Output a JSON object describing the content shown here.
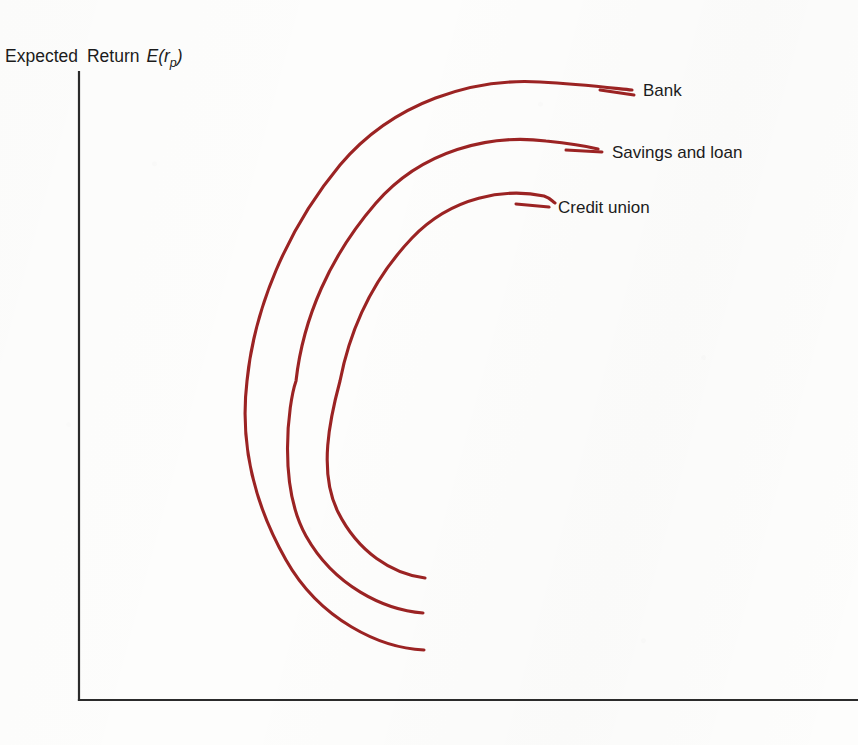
{
  "figure": {
    "background_color": "#fdfdfc",
    "axis_color": "#2b2b2b",
    "curve_color": "#9b2323",
    "width": 858,
    "height": 745
  },
  "axes": {
    "y_axis_label_part1": "Expected",
    "y_axis_label_part2": "Return",
    "y_axis_label_symbol": "E(r",
    "y_axis_label_subscript": "p",
    "y_axis_label_close": ")",
    "y_axis_label_full": "Expected Return E(r_p)",
    "x_axis_label": "",
    "origin_x": 79,
    "origin_y": 700,
    "y_axis_top": 72,
    "x_axis_right": 858
  },
  "chart_data": {
    "type": "line",
    "title": "",
    "subtitle": "",
    "xlabel": "",
    "ylabel": "Expected Return E(r_p)",
    "grid": false,
    "legend_position": "right-inline-labels",
    "axis_ticks": {
      "x": [],
      "y": []
    },
    "series": [
      {
        "name": "Bank",
        "label": "Bank",
        "color": "#9b2323",
        "rank": 1,
        "label_x": 643,
        "label_y": 96,
        "leader_line": {
          "x1": 600,
          "y1": 90,
          "x2": 634,
          "y2": 95
        },
        "path": "M 424,650 C 380,648 320,620 286,560 C 252,500 240,440 247,381 C 254,310 286,230 340,165 C 394,101 474,78 540,82 C 580,84 612,88 632,90",
        "points": [
          {
            "x": 424,
            "y": 650
          },
          {
            "x": 350,
            "y": 625
          },
          {
            "x": 290,
            "y": 565
          },
          {
            "x": 252,
            "y": 470
          },
          {
            "x": 247,
            "y": 381
          },
          {
            "x": 268,
            "y": 280
          },
          {
            "x": 320,
            "y": 190
          },
          {
            "x": 400,
            "y": 117
          },
          {
            "x": 500,
            "y": 83
          },
          {
            "x": 580,
            "y": 85
          },
          {
            "x": 632,
            "y": 90
          }
        ]
      },
      {
        "name": "Savings and loan",
        "label": "Savings and loan",
        "color": "#9b2323",
        "rank": 2,
        "label_x": 612,
        "label_y": 158,
        "leader_line": {
          "x1": 566,
          "y1": 150,
          "x2": 602,
          "y2": 152
        },
        "path": "M 423,613 C 384,610 334,586 306,536 C 278,486 288,404 296,381 C 303,318 330,256 376,203 C 422,150 490,134 546,141 C 576,144 586,146 598,149",
        "points": [
          {
            "x": 423,
            "y": 613
          },
          {
            "x": 360,
            "y": 592
          },
          {
            "x": 310,
            "y": 540
          },
          {
            "x": 292,
            "y": 455
          },
          {
            "x": 296,
            "y": 381
          },
          {
            "x": 313,
            "y": 300
          },
          {
            "x": 356,
            "y": 226
          },
          {
            "x": 428,
            "y": 166
          },
          {
            "x": 510,
            "y": 140
          },
          {
            "x": 570,
            "y": 145
          },
          {
            "x": 598,
            "y": 149
          }
        ]
      },
      {
        "name": "Credit union",
        "label": "Credit union",
        "color": "#9b2323",
        "rank": 3,
        "label_x": 558,
        "label_y": 213,
        "leader_line": {
          "x1": 516,
          "y1": 204,
          "x2": 549,
          "y2": 207
        },
        "path": "M 425,578 C 392,574 358,552 338,512 C 318,472 330,418 340,381 C 350,330 372,280 412,238 C 452,196 506,188 544,196 C 550,198 552,201 555,203",
        "points": [
          {
            "x": 425,
            "y": 578
          },
          {
            "x": 375,
            "y": 562
          },
          {
            "x": 344,
            "y": 518
          },
          {
            "x": 336,
            "y": 452
          },
          {
            "x": 340,
            "y": 381
          },
          {
            "x": 355,
            "y": 318
          },
          {
            "x": 390,
            "y": 262
          },
          {
            "x": 450,
            "y": 214
          },
          {
            "x": 515,
            "y": 194
          },
          {
            "x": 545,
            "y": 199
          },
          {
            "x": 555,
            "y": 203
          }
        ]
      }
    ]
  }
}
